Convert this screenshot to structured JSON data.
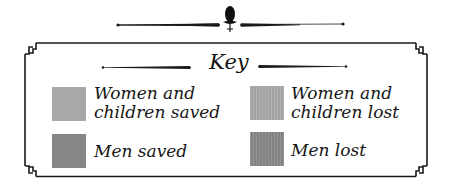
{
  "legend": {
    "title": "Key",
    "items": [
      {
        "label": "Women and\nchildren saved",
        "color": "#a8a8a8",
        "pattern": "solid"
      },
      {
        "label": "Men saved",
        "color": "#868686",
        "pattern": "solid"
      },
      {
        "label": "Women and\nchildren lost",
        "color": "#a9a9a9",
        "pattern": "vertical-stripes"
      },
      {
        "label": "Men lost",
        "color": "#888888",
        "pattern": "vertical-stripes"
      }
    ]
  },
  "colors": {
    "frame": "#1a1a1a",
    "background": "#ffffff"
  }
}
